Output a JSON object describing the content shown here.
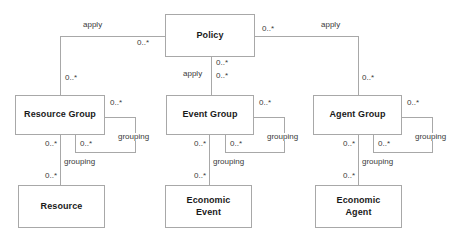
{
  "diagram": {
    "type": "uml-class-diagram",
    "background_color": "#ffffff",
    "line_color": "#a8a8a8",
    "box_border_color": "#a8a8a8",
    "box_fill_color": "#ffffff",
    "text_color": "#1a1a1a",
    "label_color": "#3a3a3a",
    "nodes": [
      {
        "id": "policy",
        "label": "Policy",
        "x": 165,
        "y": 14,
        "w": 90,
        "h": 43
      },
      {
        "id": "resource-group",
        "label": "Resource Group",
        "x": 15,
        "y": 95,
        "w": 90,
        "h": 40
      },
      {
        "id": "event-group",
        "label": "Event Group",
        "x": 166,
        "y": 95,
        "w": 88,
        "h": 40
      },
      {
        "id": "agent-group",
        "label": "Agent Group",
        "x": 313,
        "y": 95,
        "w": 89,
        "h": 40
      },
      {
        "id": "resource",
        "label": "Resource",
        "x": 18,
        "y": 185,
        "w": 87,
        "h": 43
      },
      {
        "id": "economic-event",
        "label": "Economic\nEvent",
        "x": 165,
        "y": 185,
        "w": 87,
        "h": 43
      },
      {
        "id": "economic-agent",
        "label": "Economic\nAgent",
        "x": 315,
        "y": 185,
        "w": 87,
        "h": 43
      }
    ],
    "edges": [
      {
        "id": "policy-applies-resource-group",
        "from": "policy",
        "to": "resource-group",
        "name": "apply",
        "source_multiplicity": "0..*",
        "target_multiplicity": "0..*"
      },
      {
        "id": "policy-applies-event-group",
        "from": "policy",
        "to": "event-group",
        "name": "apply",
        "source_multiplicity": "0..*",
        "target_multiplicity": "0..*"
      },
      {
        "id": "policy-applies-agent-group",
        "from": "policy",
        "to": "agent-group",
        "name": "apply",
        "source_multiplicity": "0..*",
        "target_multiplicity": "0..*"
      },
      {
        "id": "resource-group-grouping-self",
        "from": "resource-group",
        "to": "resource-group",
        "name": "grouping",
        "source_multiplicity": "0..*",
        "target_multiplicity": "0..*"
      },
      {
        "id": "event-group-grouping-self",
        "from": "event-group",
        "to": "event-group",
        "name": "grouping",
        "source_multiplicity": "0..*",
        "target_multiplicity": "0..*"
      },
      {
        "id": "agent-group-grouping-self",
        "from": "agent-group",
        "to": "agent-group",
        "name": "grouping",
        "source_multiplicity": "0..*",
        "target_multiplicity": "0..*"
      },
      {
        "id": "resource-group-grouping-resource",
        "from": "resource-group",
        "to": "resource",
        "name": "grouping",
        "source_multiplicity": "0..*",
        "target_multiplicity": "0..*"
      },
      {
        "id": "event-group-grouping-economic-event",
        "from": "event-group",
        "to": "economic-event",
        "name": "grouping",
        "source_multiplicity": "0..*",
        "target_multiplicity": "0..*"
      },
      {
        "id": "agent-group-grouping-economic-agent",
        "from": "agent-group",
        "to": "economic-agent",
        "name": "grouping",
        "source_multiplicity": "0..*",
        "target_multiplicity": "0..*"
      }
    ],
    "labels": {
      "apply_left": "apply",
      "apply_center": "apply",
      "apply_right": "apply",
      "grouping_rg_self": "grouping",
      "grouping_eg_self": "grouping",
      "grouping_ag_self": "grouping",
      "grouping_rg_resource": "grouping",
      "grouping_eg_event": "grouping",
      "grouping_ag_agent": "grouping",
      "m_policy_left": "0..*",
      "m_policy_right": "0..*",
      "m_policy_down_top": "0..*",
      "m_policy_down_bottom": "0..*",
      "m_rg_top": "0..*",
      "m_ag_top": "0..*",
      "m_rg_self_out": "0..*",
      "m_rg_self_in": "0..*",
      "m_eg_self_out": "0..*",
      "m_eg_self_in": "0..*",
      "m_ag_self_out": "0..*",
      "m_ag_self_in": "0..*",
      "m_rg_down": "0..*",
      "m_resource_up": "0..*",
      "m_eg_down": "0..*",
      "m_event_up": "0..*",
      "m_ag_down": "0..*",
      "m_agent_up": "0..*"
    }
  }
}
